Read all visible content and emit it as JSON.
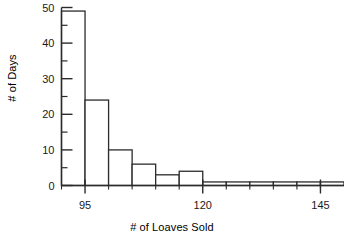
{
  "chart_data": {
    "type": "bar",
    "title": "",
    "xlabel": "# of Loaves Sold",
    "ylabel": "# of Days",
    "bin_width": 5,
    "bin_starts": [
      90,
      95,
      100,
      105,
      110,
      115,
      120,
      125,
      130,
      135,
      140,
      145
    ],
    "categories": [
      "90-95",
      "95-100",
      "100-105",
      "105-110",
      "110-115",
      "115-120",
      "120-125",
      "125-130",
      "130-135",
      "135-140",
      "140-145",
      "145-150"
    ],
    "values": [
      49,
      24,
      10,
      6,
      3,
      4,
      1,
      1,
      1,
      1,
      1,
      1
    ],
    "xlim": [
      90,
      150
    ],
    "ylim": [
      0,
      50
    ],
    "xticks_major": [
      95,
      120,
      145
    ],
    "xticks_major_labels": [
      "95",
      "120",
      "145"
    ],
    "xticks_minor": [
      90,
      100,
      105,
      110,
      115,
      125,
      130,
      135,
      140,
      145,
      150
    ],
    "yticks_major": [
      0,
      10,
      20,
      30,
      40,
      50
    ],
    "yticks_major_labels": [
      "0",
      "10",
      "20",
      "30",
      "40",
      "50"
    ],
    "yticks_minor": [
      5,
      15,
      25,
      35,
      45
    ],
    "grid": false,
    "legend": false,
    "bar_fill": "#ffffff",
    "bar_stroke": "#2b2b2b",
    "axis_color": "#2b2b2b"
  },
  "axis": {
    "y_title": "# of Days",
    "x_title": "# of Loaves Sold",
    "y_tick_labels": [
      "50",
      "40",
      "30",
      "20",
      "10",
      "0"
    ],
    "x_tick_labels": [
      "95",
      "120",
      "145"
    ]
  }
}
